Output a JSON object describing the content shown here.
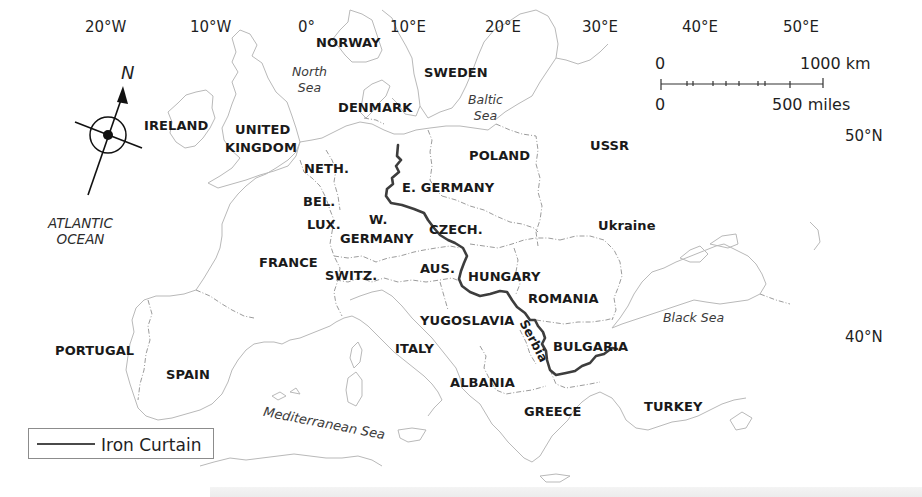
{
  "map": {
    "title": "Iron Curtain across Europe",
    "graticule": {
      "longitudes": [
        {
          "label": "20°W",
          "x": 85,
          "y": 20
        },
        {
          "label": "10°W",
          "x": 190,
          "y": 20
        },
        {
          "label": "0°",
          "x": 298,
          "y": 20
        },
        {
          "label": "10°E",
          "x": 390,
          "y": 20
        },
        {
          "label": "20°E",
          "x": 485,
          "y": 20
        },
        {
          "label": "30°E",
          "x": 582,
          "y": 20
        },
        {
          "label": "40°E",
          "x": 682,
          "y": 20
        },
        {
          "label": "50°E",
          "x": 783,
          "y": 20
        }
      ],
      "latitudes": [
        {
          "label": "50°N",
          "x": 845,
          "y": 129
        },
        {
          "label": "40°N",
          "x": 845,
          "y": 330
        }
      ]
    },
    "countries": [
      {
        "label": "NORWAY",
        "x": 316,
        "y": 36
      },
      {
        "label": "SWEDEN",
        "x": 424,
        "y": 66
      },
      {
        "label": "DENMARK",
        "x": 338,
        "y": 101
      },
      {
        "label": "IRELAND",
        "x": 144,
        "y": 119
      },
      {
        "label": "UNITED",
        "x": 235,
        "y": 123
      },
      {
        "label": "KINGDOM",
        "x": 225,
        "y": 141
      },
      {
        "label": "NETH.",
        "x": 304,
        "y": 162
      },
      {
        "label": "POLAND",
        "x": 469,
        "y": 149
      },
      {
        "label": "USSR",
        "x": 590,
        "y": 139
      },
      {
        "label": "E. GERMANY",
        "x": 402,
        "y": 181
      },
      {
        "label": "BEL.",
        "x": 303,
        "y": 195
      },
      {
        "label": "W.",
        "x": 369,
        "y": 213
      },
      {
        "label": "LUX.",
        "x": 307,
        "y": 218
      },
      {
        "label": "CZECH.",
        "x": 429,
        "y": 223
      },
      {
        "label": "GERMANY",
        "x": 340,
        "y": 232
      },
      {
        "label": "Ukraine",
        "x": 598,
        "y": 219
      },
      {
        "label": "FRANCE",
        "x": 259,
        "y": 256
      },
      {
        "label": "AUS.",
        "x": 420,
        "y": 262
      },
      {
        "label": "SWITZ.",
        "x": 325,
        "y": 269
      },
      {
        "label": "HUNGARY",
        "x": 468,
        "y": 270
      },
      {
        "label": "ROMANIA",
        "x": 528,
        "y": 292
      },
      {
        "label": "YUGOSLAVIA",
        "x": 420,
        "y": 314
      },
      {
        "label": "PORTUGAL",
        "x": 55,
        "y": 344
      },
      {
        "label": "ITALY",
        "x": 395,
        "y": 342
      },
      {
        "label": "BULGARIA",
        "x": 553,
        "y": 340
      },
      {
        "label": "SPAIN",
        "x": 166,
        "y": 368
      },
      {
        "label": "ALBANIA",
        "x": 450,
        "y": 376
      },
      {
        "label": "GREECE",
        "x": 524,
        "y": 405
      },
      {
        "label": "TURKEY",
        "x": 644,
        "y": 400
      }
    ],
    "regions": [
      {
        "label": "Serbia",
        "x": 518,
        "y": 322
      }
    ],
    "seas": [
      {
        "label": "North\nSea",
        "x": 292,
        "y": 64
      },
      {
        "label": "Baltic\nSea",
        "x": 468,
        "y": 92
      },
      {
        "label": "Black Sea",
        "x": 663,
        "y": 310
      }
    ],
    "mediterranean": {
      "label": "Mediterranean Sea",
      "x": 265,
      "y": 408
    },
    "ocean": {
      "label": "ATLANTIC\nOCEAN",
      "x": 48,
      "y": 215
    },
    "compass": {
      "north_label": "N",
      "x": 113,
      "y": 135
    },
    "scale_bar": {
      "km_start": "0",
      "km_end": "1000 km",
      "miles_start": "0",
      "miles_end": "500 miles"
    },
    "legend": {
      "label": "Iron Curtain",
      "line_color": "#4a4a4a"
    },
    "colors": {
      "iron_curtain": "#3d3d3d",
      "coastline": "#b5b5b5",
      "border": "#9a9a9a",
      "background": "#ffffff"
    },
    "iron_curtain_path": "M398,145 L397,156 L401,160 L396,166 L399,172 L392,178 L393,184 L387,189 L386,196 L391,203 L402,205 L414,209 L424,213 L428,220 L434,228 L440,235 L448,240 L455,243 L463,248 L467,256 L464,263 L461,271 L459,279 L462,286 L470,292 L480,296 L490,294 L500,291 L507,292 L512,300 L517,307 L525,313 L530,320 L535,320 L538,326 L543,332 L545,338 L542,344 L546,351 L547,360 L550,370 L556,375 L566,373 L575,371 L582,366 L590,363 L596,356 L604,354 L612,348 L617,349"
  }
}
